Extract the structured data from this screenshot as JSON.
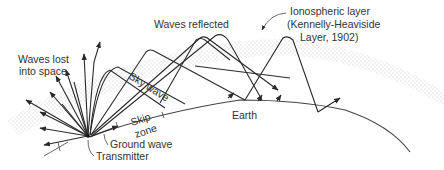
{
  "diagram": {
    "labels": {
      "waves_reflected": "Waves reflected",
      "ionospheric_layer_line1": "Ionospheric layer",
      "ionospheric_layer_line2": "(Kennelly-Heaviside",
      "ionospheric_layer_line3": "Layer, 1902)",
      "waves_lost_line1": "Waves lost",
      "waves_lost_line2": "into space",
      "sky_wave": "Sky wave",
      "skip_line1": "Skip",
      "skip_line2": "zone",
      "ground_wave": "Ground wave",
      "transmitter": "Transmitter",
      "earth": "Earth"
    },
    "colors": {
      "background": "#ffffff",
      "line": "#2a2a2a",
      "text": "#333333",
      "ionosphere_dots": "#777777"
    }
  }
}
